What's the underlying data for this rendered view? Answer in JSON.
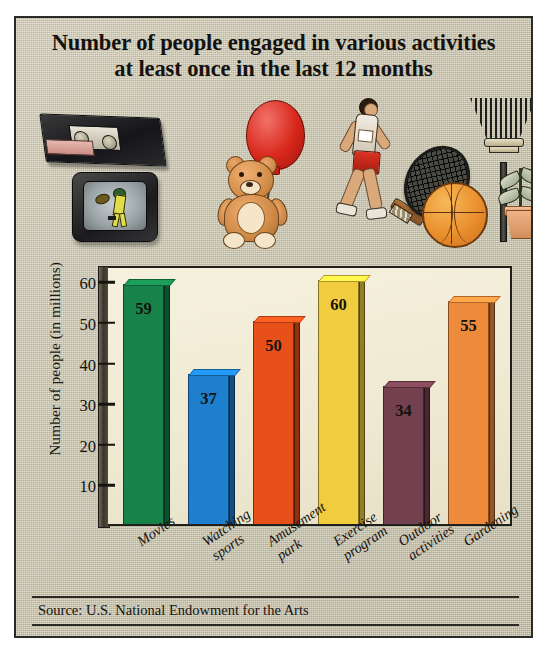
{
  "title": {
    "line1": "Number of people engaged in various activities",
    "line2": "at least once in the last 12 months"
  },
  "source": "Source: U.S. National Endowment for the Arts",
  "illustrations": [
    {
      "name": "vhs-tape-illustration",
      "represents": "Movies"
    },
    {
      "name": "television-illustration",
      "represents": "Watching sports"
    },
    {
      "name": "teddy-bear-balloon-illustration",
      "represents": "Amusement park"
    },
    {
      "name": "runner-illustration",
      "represents": "Exercise program"
    },
    {
      "name": "racket-basketball-illustration",
      "represents": "Outdoor activities"
    },
    {
      "name": "rake-plant-illustration",
      "represents": "Gardening"
    }
  ],
  "chart_data": {
    "type": "bar",
    "title": "Number of people engaged in various activities at least once in the last 12 months",
    "xlabel": "",
    "ylabel": "Number of people (in millions)",
    "ylim": [
      0,
      64
    ],
    "yticks": [
      10,
      20,
      30,
      40,
      50,
      60
    ],
    "grid": false,
    "legend": "none",
    "categories": [
      "Movies",
      "Watching sports",
      "Amusement park",
      "Exercise program",
      "Outdoor activities",
      "Gardening"
    ],
    "category_lines": [
      [
        "Movies"
      ],
      [
        "Watching",
        "sports"
      ],
      [
        "Amusement",
        "park"
      ],
      [
        "Exercise",
        "program"
      ],
      [
        "Outdoor",
        "activities"
      ],
      [
        "Gardening"
      ]
    ],
    "values": [
      59,
      37,
      50,
      60,
      34,
      55
    ],
    "bar_colors": [
      "#17824a",
      "#1d7fce",
      "#e8501a",
      "#f2cc3f",
      "#73404f",
      "#ee8a3c"
    ],
    "source": "Source: U.S. National Endowment for the Arts"
  },
  "colors": {
    "poster_background": "#cdc7ae",
    "plot_background": "#f2ecd8",
    "border": "#2a2a26",
    "text": "#15130f"
  }
}
